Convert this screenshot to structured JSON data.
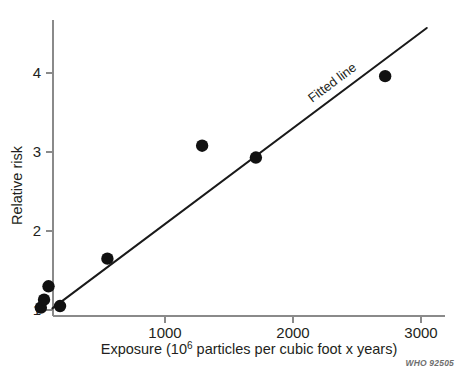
{
  "chart_data": {
    "type": "scatter",
    "title": "",
    "xlabel": "Exposure (10⁶ particles per cubic foot x years)",
    "xlabel_parts": {
      "before": "Exposure (10",
      "sup": "6",
      "after": " particles per cubic foot x years)"
    },
    "ylabel": "Relative risk",
    "xlim": [
      0,
      3000
    ],
    "ylim": [
      0.85,
      4.6
    ],
    "xticks": [
      1000,
      2000,
      3000
    ],
    "xtick_labels": [
      "1000",
      "2000",
      "3000"
    ],
    "yticks": [
      1,
      2,
      3,
      4
    ],
    "ytick_labels": [
      "1",
      "2",
      "3",
      "4"
    ],
    "grid": false,
    "legend": "none",
    "points": [
      {
        "x": 30,
        "y": 1.03
      },
      {
        "x": 55,
        "y": 1.13
      },
      {
        "x": 90,
        "y": 1.3
      },
      {
        "x": 180,
        "y": 1.05
      },
      {
        "x": 550,
        "y": 1.65
      },
      {
        "x": 1290,
        "y": 3.08
      },
      {
        "x": 1710,
        "y": 2.93
      },
      {
        "x": 2720,
        "y": 3.96
      }
    ],
    "point_marker": "filled-circle",
    "point_color": "#111111",
    "fitted_line": {
      "label": "Fitted line",
      "color": "#1a1a1a",
      "x_start": 120,
      "y_start": 1.02,
      "x_end": 3045,
      "y_end": 4.57
    }
  },
  "annotations": {
    "fitted_line_label": "Fitted line"
  },
  "credit": {
    "text": "WHO 92505"
  },
  "colors": {
    "axis": "#8a8a8a",
    "text": "#231f20",
    "marker": "#111111",
    "line": "#1a1a1a",
    "credit": "#6e6e6e",
    "background": "#ffffff"
  }
}
